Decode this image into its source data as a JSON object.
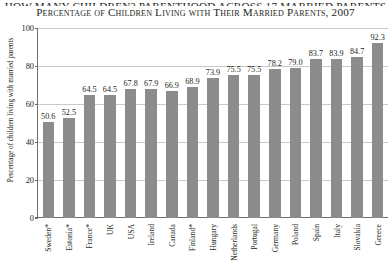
{
  "titles": {
    "line1": "HOW MANY CHILDREN? PARENTHOOD ACROSS 17 MARRIED PARENTS",
    "line2": "Percentage of Children Living with Their Married Parents, 2007"
  },
  "chart_data": {
    "type": "bar",
    "title": "Percentage of Children Living with Their Married Parents, 2007",
    "xlabel": "",
    "ylabel": "Percentage of children living with married parents",
    "ylim": [
      0,
      100
    ],
    "yticks": [
      0,
      20,
      40,
      60,
      80,
      100
    ],
    "grid": true,
    "legend": "none",
    "bar_color": "#8c8c8c",
    "categories": [
      "Sweden*",
      "Estonia*",
      "France*",
      "UK",
      "USA",
      "Ireland",
      "Canada",
      "Finland*",
      "Hungary",
      "Netherlands",
      "Portugal",
      "Germany",
      "Poland",
      "Spain",
      "Italy",
      "Slovakia",
      "Greece"
    ],
    "values": [
      50.6,
      52.5,
      64.5,
      64.5,
      67.8,
      67.9,
      66.9,
      68.9,
      73.9,
      75.5,
      75.5,
      78.2,
      79.0,
      83.7,
      83.9,
      84.7,
      92.3
    ],
    "value_labels": [
      "50.6",
      "52.5",
      "64.5",
      "64.5",
      "67.8",
      "67.9",
      "66.9",
      "68.9",
      "73.9",
      "75.5",
      "75.5",
      "78.2",
      "79.0",
      "83.7",
      "83.9",
      "84.7",
      "92.3"
    ]
  }
}
